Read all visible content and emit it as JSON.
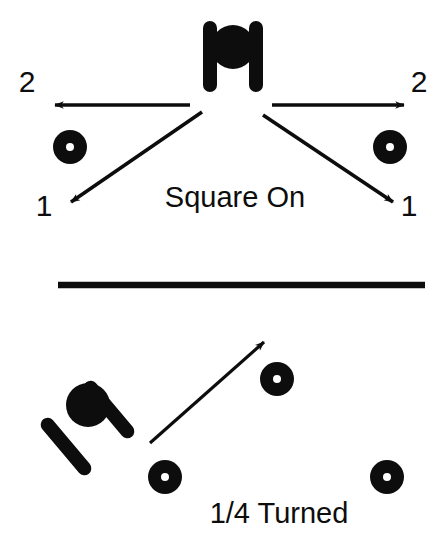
{
  "diagram": {
    "colors": {
      "ink": "#0d0d0d",
      "background": "#ffffff",
      "marker_hole": "#ffffff"
    },
    "panels": [
      {
        "id": "square-on",
        "caption": "Square On",
        "caption_x": 235,
        "caption_y": 207,
        "figure": {
          "name": "player-square-on",
          "head": {
            "cx": 233,
            "cy": 47,
            "r": 22
          },
          "arms": [
            {
              "name": "left-arm",
              "x": 203,
              "y": 21,
              "w": 14,
              "h": 71,
              "rotate": 0
            },
            {
              "name": "right-arm",
              "x": 249,
              "y": 21,
              "w": 14,
              "h": 71,
              "rotate": 0
            }
          ]
        },
        "markers": [
          {
            "name": "marker-left",
            "cx": 70,
            "cy": 147,
            "r": 17,
            "hole": 4
          },
          {
            "name": "marker-right",
            "cx": 390,
            "cy": 147,
            "r": 17,
            "hole": 4
          }
        ],
        "arrows": [
          {
            "name": "arrow-left-2",
            "x1": 190,
            "y1": 105,
            "x2": 50,
            "y2": 105,
            "label": "2",
            "label_x": 27,
            "label_y": 92
          },
          {
            "name": "arrow-right-2",
            "x1": 272,
            "y1": 105,
            "x2": 409,
            "y2": 105,
            "label": "2",
            "label_x": 419,
            "label_y": 92
          },
          {
            "name": "arrow-left-1",
            "x1": 202,
            "y1": 112,
            "x2": 66,
            "y2": 205,
            "label": "1",
            "label_x": 44,
            "label_y": 216
          },
          {
            "name": "arrow-right-1",
            "x1": 263,
            "y1": 115,
            "x2": 398,
            "y2": 205,
            "label": "1",
            "label_x": 409,
            "label_y": 216
          }
        ]
      },
      {
        "id": "quarter-turned",
        "caption": "1/4 Turned",
        "caption_x": 279,
        "caption_y": 523,
        "figure": {
          "name": "player-quarter-turned",
          "head": {
            "cx": 88,
            "cy": 405,
            "r": 22
          },
          "arms": [
            {
              "name": "upper-arm",
              "x": 102,
              "y": 374,
              "w": 14,
              "h": 71,
              "rotate": -40
            },
            {
              "name": "lower-arm",
              "x": 59,
              "y": 411,
              "w": 14,
              "h": 71,
              "rotate": -40
            }
          ]
        },
        "markers": [
          {
            "name": "marker-upper-right",
            "cx": 277,
            "cy": 379,
            "r": 17,
            "hole": 4
          },
          {
            "name": "marker-bottom-left",
            "cx": 165,
            "cy": 477,
            "r": 17,
            "hole": 4
          },
          {
            "name": "marker-bottom-right",
            "cx": 387,
            "cy": 477,
            "r": 17,
            "hole": 4
          }
        ],
        "arrows": [
          {
            "name": "arrow-diagonal",
            "x1": 150,
            "y1": 443,
            "x2": 269,
            "y2": 337,
            "label": "",
            "label_x": 0,
            "label_y": 0
          }
        ]
      }
    ],
    "divider": {
      "name": "panel-divider",
      "x1": 58,
      "y1": 285,
      "x2": 425,
      "y2": 285,
      "thickness": 6
    },
    "labels": {
      "two_left": "2",
      "two_right": "2",
      "one_left": "1",
      "one_right": "1",
      "caption_top": "Square On",
      "caption_bottom": "1/4 Turned"
    }
  }
}
